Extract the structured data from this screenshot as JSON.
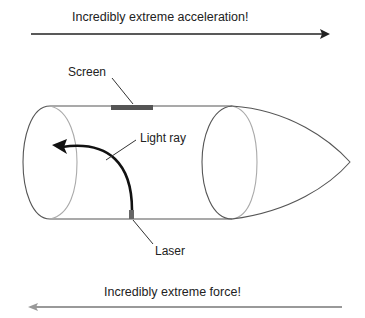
{
  "diagram": {
    "top_arrow": {
      "label": "Incredibly extreme acceleration!",
      "direction": "right",
      "color": "#222222"
    },
    "bottom_arrow": {
      "label": "Incredibly extreme force!",
      "direction": "left",
      "color": "#999999"
    },
    "labels": {
      "screen": "Screen",
      "light_ray": "Light ray",
      "laser": "Laser"
    },
    "colors": {
      "screen": "#555555",
      "laser": "#666666",
      "ray": "#111111",
      "outline": "#555555"
    }
  }
}
